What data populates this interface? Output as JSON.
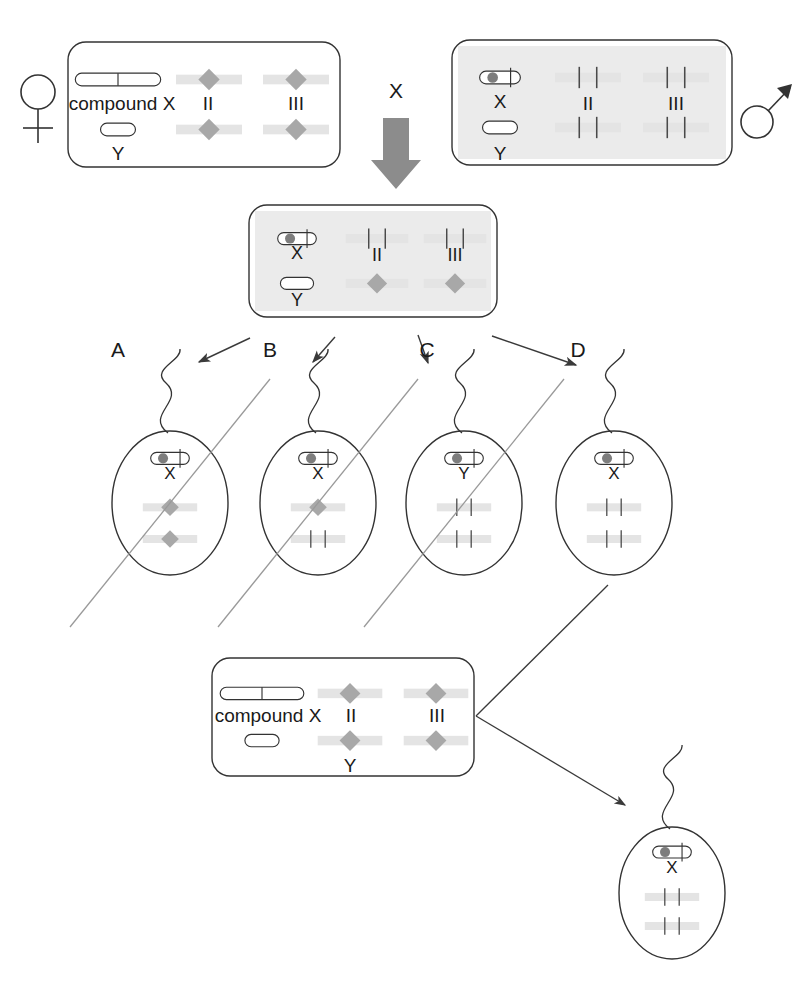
{
  "figure": {
    "type": "genetics-cross-diagram",
    "cross_symbol": "X"
  },
  "colors": {
    "outline": "#333333",
    "text": "#1a1a1a",
    "chromosome_band": "#d2d2d2",
    "chromosome_band_light": "#e4e4e4",
    "diamond": "#a8a8a8",
    "centromere_dot": "#7d7d7d",
    "shaded_box_fill": "#ebebeb",
    "big_arrow": "#8c8c8c",
    "strike_line": "#9a9a9a",
    "thin_arrow": "#3a3a3a"
  },
  "parents": {
    "female": {
      "sex_symbol": "female-symbol",
      "shaded": false,
      "rows": [
        {
          "sex_chromosome": {
            "glyph": "compound-x",
            "label": "compound X"
          },
          "autosomes": [
            {
              "label": "II",
              "kind": "diamond"
            },
            {
              "label": "III",
              "kind": "diamond"
            }
          ]
        },
        {
          "sex_chromosome": {
            "glyph": "y",
            "label": "Y"
          },
          "autosomes": [
            {
              "label": "",
              "kind": "diamond"
            },
            {
              "label": "",
              "kind": "diamond"
            }
          ]
        }
      ]
    },
    "male": {
      "sex_symbol": "male-symbol",
      "shaded": true,
      "rows": [
        {
          "sex_chromosome": {
            "glyph": "x-dot",
            "label": "X"
          },
          "autosomes": [
            {
              "label": "II",
              "kind": "ticks"
            },
            {
              "label": "III",
              "kind": "ticks"
            }
          ]
        },
        {
          "sex_chromosome": {
            "glyph": "y",
            "label": "Y"
          },
          "autosomes": [
            {
              "label": "",
              "kind": "ticks"
            },
            {
              "label": "",
              "kind": "ticks"
            }
          ]
        }
      ]
    }
  },
  "f1": {
    "shaded": true,
    "rows": [
      {
        "sex_chromosome": {
          "glyph": "x-dot",
          "label": "X"
        },
        "autosomes": [
          {
            "label": "II",
            "kind": "ticks"
          },
          {
            "label": "III",
            "kind": "ticks"
          }
        ]
      },
      {
        "sex_chromosome": {
          "glyph": "y",
          "label": "Y"
        },
        "autosomes": [
          {
            "label": "",
            "kind": "diamond"
          },
          {
            "label": "",
            "kind": "diamond"
          }
        ]
      }
    ]
  },
  "sperm": [
    {
      "label": "A",
      "sex_chromosome": {
        "glyph": "x-dot",
        "label": "X"
      },
      "autosomes": [
        {
          "kind": "diamond"
        },
        {
          "kind": "diamond"
        }
      ],
      "struck_out": true
    },
    {
      "label": "B",
      "sex_chromosome": {
        "glyph": "x-dot",
        "label": "X"
      },
      "autosomes": [
        {
          "kind": "diamond"
        },
        {
          "kind": "ticks"
        }
      ],
      "struck_out": true
    },
    {
      "label": "C",
      "sex_chromosome": {
        "glyph": "x-dot",
        "label": "Y"
      },
      "autosomes": [
        {
          "kind": "ticks"
        },
        {
          "kind": "ticks"
        }
      ],
      "struck_out": true
    },
    {
      "label": "D",
      "sex_chromosome": {
        "glyph": "x-dot",
        "label": "X"
      },
      "autosomes": [
        {
          "kind": "ticks"
        },
        {
          "kind": "ticks"
        }
      ],
      "struck_out": false
    }
  ],
  "tester_female": {
    "shaded": false,
    "rows": [
      {
        "sex_chromosome": {
          "glyph": "compound-x",
          "label": "compound X"
        },
        "autosomes": [
          {
            "label": "II",
            "kind": "diamond"
          },
          {
            "label": "III",
            "kind": "diamond"
          }
        ]
      },
      {
        "sex_chromosome": {
          "glyph": "y",
          "label": "Y"
        },
        "autosomes": [
          {
            "label": "",
            "kind": "diamond"
          },
          {
            "label": "",
            "kind": "diamond"
          }
        ]
      }
    ]
  },
  "result_sperm": {
    "label": "",
    "sex_chromosome": {
      "glyph": "x-dot",
      "label": "X"
    },
    "autosomes": [
      {
        "kind": "ticks"
      },
      {
        "kind": "ticks"
      }
    ],
    "struck_out": false
  }
}
